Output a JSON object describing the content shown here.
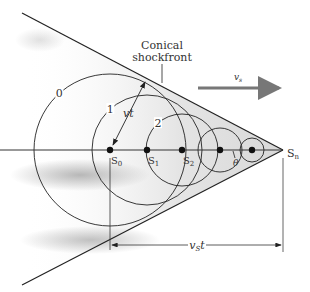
{
  "diagram": {
    "title_label": [
      "Conical",
      "shockfront"
    ],
    "velocity_label": "v",
    "velocity_subscript": "s",
    "radius_label": "vt",
    "distance_label_main": "v",
    "distance_label_sub": "S",
    "distance_label_tail": "t",
    "angle_label": "θ",
    "apex_label": "S",
    "apex_sub": "n",
    "sources": [
      {
        "label": "S",
        "sub": "0",
        "x": 110
      },
      {
        "label": "S",
        "sub": "1",
        "x": 147
      },
      {
        "label": "S",
        "sub": "2",
        "x": 182
      },
      {
        "label": "",
        "sub": "",
        "x": 220
      },
      {
        "label": "",
        "sub": "",
        "x": 252
      }
    ],
    "wavefronts": [
      {
        "label": "0",
        "cx": 110,
        "r": 76
      },
      {
        "label": "1",
        "cx": 147,
        "r": 55
      },
      {
        "label": "2",
        "cx": 182,
        "r": 36
      },
      {
        "label": "",
        "cx": 220,
        "r": 22
      },
      {
        "label": "",
        "cx": 252,
        "r": 12
      }
    ],
    "colors": {
      "line": "#222222",
      "arrow_gray": "#777777",
      "shade": "#bdbdbd"
    }
  }
}
